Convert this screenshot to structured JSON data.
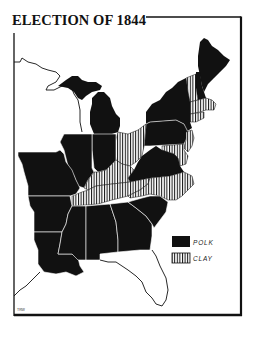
{
  "title": "ELECTION OF 1844",
  "legend": {
    "items": [
      {
        "label": "POLK",
        "fill": "#111111",
        "pattern": "solid"
      },
      {
        "label": "CLAY",
        "fill": "#ffffff",
        "pattern": "vertical-hatch"
      }
    ]
  },
  "credit": "TRW",
  "colors": {
    "polk": "#111111",
    "clay_hatch": "#111111",
    "background": "#ffffff",
    "frame": "#111111"
  },
  "states": {
    "polk": [
      "Maine",
      "New Hampshire",
      "New York",
      "Pennsylvania",
      "Michigan",
      "Indiana",
      "Illinois",
      "Missouri",
      "Arkansas",
      "Louisiana",
      "Mississippi",
      "Alabama",
      "Georgia",
      "South Carolina",
      "Virginia"
    ],
    "clay": [
      "Vermont",
      "Massachusetts",
      "Rhode Island",
      "Connecticut",
      "New Jersey",
      "Delaware",
      "Maryland",
      "Ohio",
      "Kentucky",
      "Tennessee",
      "North Carolina"
    ],
    "unshaded": [
      "Florida",
      "Wisconsin Territory",
      "Iowa Territory"
    ]
  }
}
